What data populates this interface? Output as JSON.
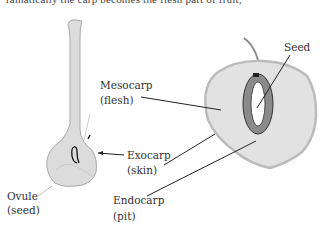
{
  "top_text_fragment": "ramatically the carp becomes the flesh part of fruit,",
  "labels": {
    "seed": "Seed",
    "mesocarp": "Mesocarp",
    "mesocarp_sub": "(flesh)",
    "exocarp": "Exocarp",
    "exocarp_sub": "(skin)",
    "ovule": "Ovule",
    "ovule_sub": "(seed)",
    "endocarp": "Endocarp",
    "endocarp_sub": "(pit)"
  },
  "colors": {
    "fruit_fill": "#e2e2e2",
    "fruit_edge": "#b9b9b9",
    "pit_fill": "#8a8a8a",
    "line": "#222222"
  }
}
